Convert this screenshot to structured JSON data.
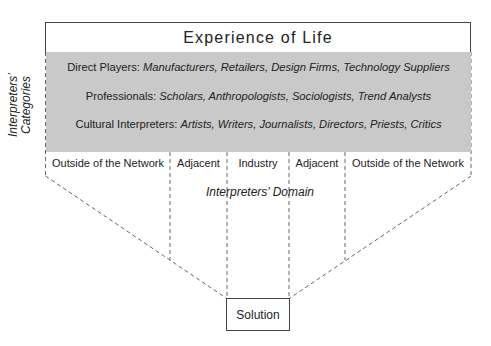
{
  "title": "Experience of Life",
  "side_label": {
    "line1": "Interpreters’",
    "line2": "Categories"
  },
  "categories": [
    {
      "label": "Direct Players:",
      "items": "Manufacturers, Retailers, Design Firms, Technology Suppliers"
    },
    {
      "label": "Professionals:",
      "items": "Scholars, Anthropologists, Sociologists, Trend Analysts"
    },
    {
      "label": "Cultural Interpreters:",
      "items": "Artists, Writers, Journalists, Directors, Priests, Critics"
    }
  ],
  "columns": [
    {
      "label": "Outside of the Network"
    },
    {
      "label": "Adjacent"
    },
    {
      "label": "Industry"
    },
    {
      "label": "Adjacent"
    },
    {
      "label": "Outside of the Network"
    }
  ],
  "domain_label": "Interpreters’ Domain",
  "solution": "Solution",
  "colors": {
    "gray_fill": "#c9c9c9",
    "border": "#444444",
    "text": "#222222",
    "dash": "#666666"
  }
}
